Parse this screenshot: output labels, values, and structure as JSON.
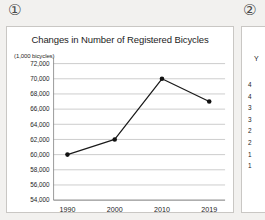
{
  "markers": {
    "first": "①",
    "second": "②"
  },
  "panel1": {
    "title": "Changes in Number of Registered Bicycles",
    "unit_label": "(1,000 bicycles)"
  },
  "panel2": {
    "header_fragment": "Y",
    "row_fragments": [
      "4",
      "4",
      "3",
      "3",
      "2",
      "2",
      "1",
      "1",
      "",
      ""
    ]
  },
  "chart_data": {
    "type": "line",
    "title": "Changes in Number of Registered Bicycles",
    "xlabel": "",
    "ylabel": "(1,000 bicycles)",
    "categories": [
      "1990",
      "2000",
      "2010",
      "2019"
    ],
    "values": [
      60000,
      62000,
      70000,
      67000
    ],
    "ylim": [
      54000,
      72000
    ],
    "ytick_step": 2000,
    "ytick_labels": [
      "72,000",
      "70,000",
      "68,000",
      "66,000",
      "64,000",
      "62,000",
      "60,000",
      "58,000",
      "56,000",
      "54,000"
    ],
    "xtick_labels": [
      "1990",
      "2000",
      "2010",
      "2019"
    ],
    "grid": true,
    "legend": false,
    "markers": true,
    "line_color": "#1a1a1a",
    "marker_color": "#121212",
    "grid_color": "#9a9a9a"
  }
}
